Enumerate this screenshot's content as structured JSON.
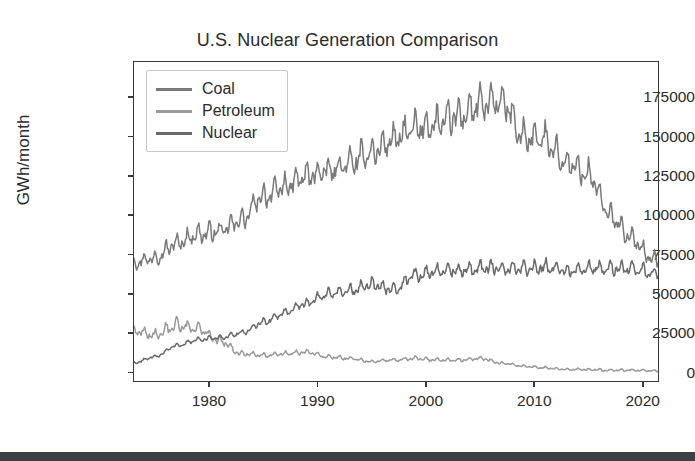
{
  "figure": {
    "title": "U.S. Nuclear Generation Comparison",
    "ylabel": "GWh/month",
    "background_color": "#ffffff",
    "frame_color": "#3a3a3a",
    "bottom_bar_color": "#3c3f44"
  },
  "legend": {
    "position": "upper left",
    "entries": [
      {
        "label": "Coal",
        "color": "#7a7a7a"
      },
      {
        "label": "Petroleum",
        "color": "#9a9a9a"
      },
      {
        "label": "Nuclear",
        "color": "#6a6a6a"
      }
    ]
  },
  "axes": {
    "y_ticks": [
      "0",
      "25000",
      "50000",
      "75000",
      "100000",
      "125000",
      "150000",
      "175000"
    ],
    "x_ticks": [
      "1980",
      "1990",
      "2000",
      "2010",
      "2020"
    ]
  },
  "chart_data": {
    "type": "line",
    "title": "U.S. Nuclear Generation Comparison",
    "xlabel": "",
    "ylabel": "GWh/month",
    "xlim": [
      1973,
      2021.5
    ],
    "ylim": [
      -6000,
      198000
    ],
    "x_ticks": [
      1980,
      1990,
      2000,
      2010,
      2020
    ],
    "y_ticks": [
      0,
      25000,
      50000,
      75000,
      100000,
      125000,
      150000,
      175000
    ],
    "grid": false,
    "legend_position": "upper left",
    "x_description": "Monthly observations from 1973 through mid-2021; strong seasonal (summer/winter peak) oscillation superimposed on each trend.",
    "series": [
      {
        "name": "Coal",
        "color": "#7a7a7a",
        "seasonal_amplitude": 11000,
        "trend_description": "Rises from about 70000 GWh/month in 1973 to a broad peak near 185000 around 2005-2007, then declines steeply after 2008 with a sharp drop around 2012 and again after 2015, ending near 65000-85000 in 2021.",
        "x": [
          1973,
          1975,
          1977,
          1979,
          1981,
          1983,
          1985,
          1987,
          1989,
          1991,
          1993,
          1995,
          1997,
          1999,
          2001,
          2003,
          2005,
          2007,
          2009,
          2011,
          2013,
          2015,
          2017,
          2019,
          2021
        ],
        "values": [
          70000,
          73000,
          82000,
          88000,
          90000,
          97000,
          112000,
          118000,
          125000,
          128000,
          133000,
          140000,
          148000,
          155000,
          158000,
          163000,
          170000,
          172000,
          150000,
          148000,
          133000,
          126000,
          100000,
          85000,
          72000
        ]
      },
      {
        "name": "Petroleum",
        "color": "#9a9a9a",
        "seasonal_amplitude": 4000,
        "trend_description": "Starts near 27000 GWh/month with high volatility through the 1970s, declines through the 1980s to roughly 10000, drifts down through the 1990s and 2000s, and falls to nearly 0 after 2012.",
        "x": [
          1973,
          1975,
          1977,
          1979,
          1981,
          1983,
          1985,
          1987,
          1989,
          1991,
          1993,
          1995,
          1997,
          1999,
          2001,
          2003,
          2005,
          2007,
          2009,
          2011,
          2013,
          2015,
          2017,
          2019,
          2021
        ],
        "values": [
          27000,
          24000,
          30000,
          28000,
          20000,
          12000,
          11000,
          12000,
          13000,
          10000,
          9000,
          7000,
          8000,
          9000,
          8000,
          8000,
          9000,
          6000,
          4000,
          3000,
          2000,
          2000,
          1500,
          1500,
          1200
        ]
      },
      {
        "name": "Nuclear",
        "color": "#6a6a6a",
        "seasonal_amplitude": 4500,
        "trend_description": "Begins near 6000 GWh/month in 1973, climbs steadily through the 1980s and 1990s, reaches a plateau of roughly 65000-70000 after 2000, and stays flat through 2021 where coal drops below it.",
        "x": [
          1973,
          1975,
          1977,
          1979,
          1981,
          1983,
          1985,
          1987,
          1989,
          1991,
          1993,
          1995,
          1997,
          1999,
          2001,
          2003,
          2005,
          2007,
          2009,
          2011,
          2013,
          2015,
          2017,
          2019,
          2021
        ],
        "values": [
          6000,
          10000,
          17000,
          21000,
          22000,
          25000,
          32000,
          38000,
          44000,
          50000,
          52000,
          56000,
          53000,
          62000,
          64000,
          65000,
          66000,
          67000,
          66000,
          67000,
          65000,
          66000,
          66000,
          66000,
          63000
        ]
      }
    ]
  }
}
